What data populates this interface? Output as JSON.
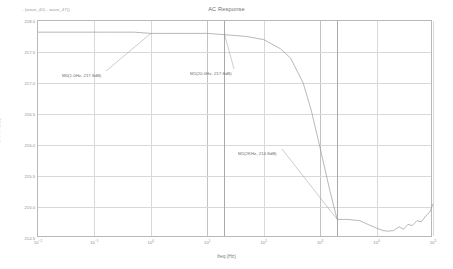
{
  "legend": {
    "text": "- (wave_40) - wave_47()"
  },
  "title": "AC Response",
  "axes": {
    "xlabel": "freq (Hz)",
    "ylabel": "CMRR (dB)"
  },
  "markers": [
    {
      "name": "M0",
      "label": "M0(1.0Hz, 217.8dB)",
      "freq": 1.0,
      "value": 217.8
    },
    {
      "name": "M1",
      "label": "M1(20.0Hz, 217.8dB)",
      "freq": 20.0,
      "value": 217.8
    },
    {
      "name": "M2",
      "label": "M1(2KHz, 214.8dB)",
      "freq": 2000.0,
      "value": 214.8
    }
  ],
  "colors": {
    "trace": "#9a9a9a",
    "grid": "#d8d8d8",
    "frame": "#b8b8b8",
    "text": "#6f6f6f"
  },
  "chart_data": {
    "type": "line",
    "title": "AC Response",
    "xlabel": "freq (Hz)",
    "ylabel": "CMRR (dB)",
    "xscale": "log",
    "xlim": [
      0.01,
      100000
    ],
    "ylim": [
      214.5,
      218.0
    ],
    "grid": true,
    "legend": "- (wave_40) - wave_47()",
    "xticks": [
      "10-2",
      "10-1",
      "100",
      "101",
      "102",
      "103",
      "104",
      "105"
    ],
    "xtick_labels": [
      "10⁻²",
      "10⁻¹",
      "10⁰",
      "10¹",
      "10²",
      "10³",
      "10⁴",
      "10⁵"
    ],
    "yticks": [
      214.5,
      215.0,
      215.5,
      216.0,
      216.5,
      217.0,
      217.5,
      218.0
    ],
    "ytick_labels": [
      "214.5",
      "215.0",
      "215.5",
      "216.0",
      "216.5",
      "217.0",
      "217.5",
      "218.0"
    ],
    "series": [
      {
        "name": "wave_40 - wave_47",
        "x": [
          0.01,
          0.02,
          0.05,
          0.1,
          0.2,
          0.5,
          1.0,
          2.0,
          5.0,
          10.0,
          20.0,
          50.0,
          100.0,
          200.0,
          300.0,
          500.0,
          700.0,
          1000.0,
          1500.0,
          2000.0,
          3000.0,
          5000.0,
          7000.0,
          10000.0,
          13000.0,
          16000.0,
          20000.0,
          25000.0,
          30000.0,
          36000.0,
          43000.0,
          52000.0,
          62000.0,
          75000.0,
          88000.0,
          100000.0
        ],
        "y": [
          217.82,
          217.82,
          217.82,
          217.82,
          217.82,
          217.82,
          217.8,
          217.8,
          217.8,
          217.8,
          217.78,
          217.75,
          217.7,
          217.55,
          217.4,
          217.0,
          216.55,
          215.95,
          215.25,
          214.8,
          214.8,
          214.78,
          214.72,
          214.66,
          214.62,
          214.61,
          214.62,
          214.68,
          214.64,
          214.72,
          214.7,
          214.78,
          214.76,
          214.86,
          214.92,
          215.05
        ]
      }
    ],
    "annotations": [
      {
        "text": "M0(1.0Hz, 217.8dB)",
        "x": 1.0,
        "y": 217.8
      },
      {
        "text": "M1(20.0Hz, 217.8dB)",
        "x": 20.0,
        "y": 217.8
      },
      {
        "text": "M1(2KHz, 214.8dB)",
        "x": 2000.0,
        "y": 214.8
      }
    ]
  }
}
